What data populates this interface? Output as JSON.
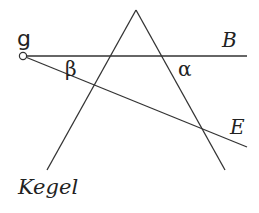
{
  "diagram": {
    "labels": {
      "point": "g",
      "line_b": "B",
      "line_e": "E",
      "angle_beta": "β",
      "angle_alpha": "α",
      "cone": "Kegel"
    },
    "colors": {
      "stroke": "#333333",
      "text": "#222222",
      "background": "#ffffff"
    },
    "geometry": {
      "point_g": [
        23,
        56
      ],
      "line_b_end": [
        247,
        56
      ],
      "line_e_end": [
        247,
        147
      ],
      "cone_apex": [
        136,
        10
      ],
      "cone_left_end": [
        47,
        170
      ],
      "cone_right_end": [
        225,
        170
      ]
    }
  }
}
